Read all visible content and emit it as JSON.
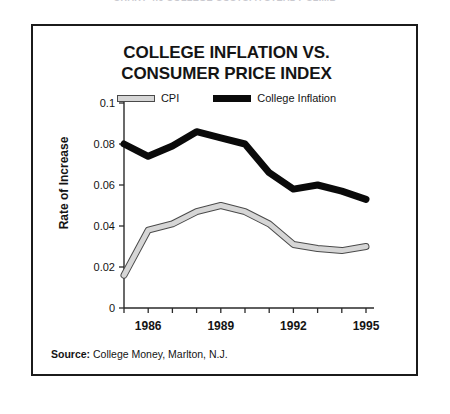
{
  "page": {
    "clipped_headline": "CHART 4.6  COLLEGE COSTS: A STEADY CLIMB"
  },
  "figure": {
    "title_line1": "COLLEGE INFLATION VS.",
    "title_line2": "CONSUMER PRICE INDEX",
    "source_label": "Source:",
    "source_text": " College Money, Marlton, N.J.",
    "legend": [
      {
        "label": "CPI",
        "color": "#d6d6d6",
        "edge": "#4a4a4a",
        "key": "cpi-swatch"
      },
      {
        "label": "College Inflation",
        "color": "#0a0a0a",
        "edge": "#0a0a0a",
        "key": "college-swatch"
      }
    ]
  },
  "chart_data": {
    "type": "line",
    "title": "COLLEGE INFLATION VS. CONSUMER PRICE INDEX",
    "subtitle": "",
    "xlabel": "",
    "ylabel": "Rate of Increase",
    "x": [
      1985,
      1986,
      1987,
      1988,
      1989,
      1990,
      1991,
      1992,
      1993,
      1994,
      1995
    ],
    "xtick_labels": [
      "1986",
      "1989",
      "1992",
      "1995"
    ],
    "xtick_values": [
      1986,
      1989,
      1992,
      1995
    ],
    "xlim": [
      1985,
      1995
    ],
    "ytick_labels": [
      "0",
      "0.02",
      "0.04",
      "0.06",
      "0.08",
      "0.1"
    ],
    "ytick_values": [
      0,
      0.02,
      0.04,
      0.06,
      0.08,
      0.1
    ],
    "ylim": [
      0,
      0.1
    ],
    "grid": false,
    "legend_position": "top-center",
    "series": [
      {
        "name": "CPI",
        "color": "#d6d6d6",
        "edge_color": "#4a4a4a",
        "values": [
          0.016,
          0.038,
          0.041,
          0.047,
          0.05,
          0.047,
          0.041,
          0.031,
          0.029,
          0.028,
          0.03
        ]
      },
      {
        "name": "College Inflation",
        "color": "#0a0a0a",
        "edge_color": "#0a0a0a",
        "values": [
          0.08,
          0.074,
          0.079,
          0.086,
          0.083,
          0.08,
          0.066,
          0.058,
          0.06,
          0.057,
          0.053
        ]
      }
    ]
  }
}
